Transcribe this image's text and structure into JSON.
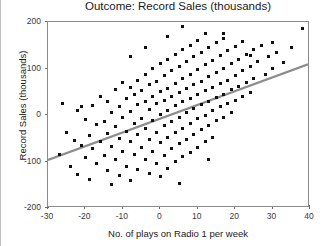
{
  "chart_data": {
    "type": "scatter",
    "title": "Outcome: Record Sales (thousands)",
    "xlabel": "No. of plays on Radio 1 per week",
    "ylabel": "Record Sales (thousands)",
    "xlim": [
      -30,
      40
    ],
    "ylim": [
      -200,
      200
    ],
    "xticks": [
      -30,
      -20,
      -10,
      0,
      10,
      20,
      30,
      40
    ],
    "yticks": [
      -200,
      -100,
      0,
      100,
      200
    ],
    "grid": false,
    "legend": null,
    "marker": "square",
    "marker_color": "#101010",
    "trendline": {
      "name": "linear fit",
      "color": "#8c8c8c",
      "x_start": -30,
      "y_start": -100,
      "x_end": 40,
      "y_end": 108,
      "slope": 2.97,
      "intercept": -10.9
    },
    "points": [
      [
        -27,
        -85
      ],
      [
        -25,
        -38
      ],
      [
        -24,
        -110
      ],
      [
        -23,
        -55
      ],
      [
        -22,
        10
      ],
      [
        -22,
        -128
      ],
      [
        -21,
        -66
      ],
      [
        -20,
        -10
      ],
      [
        -20,
        -92
      ],
      [
        -19,
        -45
      ],
      [
        -19,
        -138
      ],
      [
        -18,
        20
      ],
      [
        -18,
        -72
      ],
      [
        -17,
        -20
      ],
      [
        -17,
        -105
      ],
      [
        -16,
        40
      ],
      [
        -16,
        -58
      ],
      [
        -15,
        -15
      ],
      [
        -15,
        -88
      ],
      [
        -14,
        30
      ],
      [
        -14,
        -40
      ],
      [
        -14,
        -120
      ],
      [
        -13,
        5
      ],
      [
        -13,
        -68
      ],
      [
        -12,
        55
      ],
      [
        -12,
        -25
      ],
      [
        -12,
        -95
      ],
      [
        -11,
        18
      ],
      [
        -11,
        -50
      ],
      [
        -11,
        -130
      ],
      [
        -10,
        70
      ],
      [
        -10,
        -5
      ],
      [
        -10,
        -78
      ],
      [
        -9,
        35
      ],
      [
        -9,
        -35
      ],
      [
        -9,
        -110
      ],
      [
        -8,
        60
      ],
      [
        -8,
        8
      ],
      [
        -8,
        -58
      ],
      [
        -8,
        -140
      ],
      [
        -7,
        45
      ],
      [
        -7,
        -18
      ],
      [
        -7,
        -85
      ],
      [
        -6,
        75
      ],
      [
        -6,
        22
      ],
      [
        -6,
        -42
      ],
      [
        -6,
        -118
      ],
      [
        -5,
        52
      ],
      [
        -5,
        -8
      ],
      [
        -5,
        -70
      ],
      [
        -4,
        88
      ],
      [
        -4,
        30
      ],
      [
        -4,
        -28
      ],
      [
        -4,
        -95
      ],
      [
        -3,
        65
      ],
      [
        -3,
        12
      ],
      [
        -3,
        -52
      ],
      [
        -3,
        -125
      ],
      [
        -2,
        100
      ],
      [
        -2,
        40
      ],
      [
        -2,
        -12
      ],
      [
        -2,
        -78
      ],
      [
        -1,
        72
      ],
      [
        -1,
        25
      ],
      [
        -1,
        -38
      ],
      [
        -1,
        -105
      ],
      [
        0,
        110
      ],
      [
        0,
        50
      ],
      [
        0,
        2
      ],
      [
        0,
        -60
      ],
      [
        0,
        -132
      ],
      [
        1,
        85
      ],
      [
        1,
        32
      ],
      [
        1,
        -22
      ],
      [
        1,
        -88
      ],
      [
        2,
        120
      ],
      [
        2,
        58
      ],
      [
        2,
        10
      ],
      [
        2,
        -48
      ],
      [
        2,
        -115
      ],
      [
        3,
        95
      ],
      [
        3,
        40
      ],
      [
        3,
        -15
      ],
      [
        3,
        -72
      ],
      [
        4,
        130
      ],
      [
        4,
        68
      ],
      [
        4,
        20
      ],
      [
        4,
        -38
      ],
      [
        4,
        -100
      ],
      [
        5,
        105
      ],
      [
        5,
        48
      ],
      [
        5,
        -5
      ],
      [
        5,
        -62
      ],
      [
        6,
        140
      ],
      [
        6,
        78
      ],
      [
        6,
        28
      ],
      [
        6,
        -28
      ],
      [
        6,
        -90
      ],
      [
        7,
        115
      ],
      [
        7,
        58
      ],
      [
        7,
        5
      ],
      [
        7,
        -52
      ],
      [
        8,
        150
      ],
      [
        8,
        88
      ],
      [
        8,
        35
      ],
      [
        8,
        -18
      ],
      [
        8,
        -80
      ],
      [
        9,
        125
      ],
      [
        9,
        65
      ],
      [
        9,
        15
      ],
      [
        9,
        -42
      ],
      [
        10,
        160
      ],
      [
        10,
        98
      ],
      [
        10,
        45
      ],
      [
        10,
        -8
      ],
      [
        10,
        -70
      ],
      [
        11,
        135
      ],
      [
        11,
        72
      ],
      [
        11,
        22
      ],
      [
        11,
        -32
      ],
      [
        12,
        175
      ],
      [
        12,
        108
      ],
      [
        12,
        52
      ],
      [
        12,
        0
      ],
      [
        12,
        -58
      ],
      [
        13,
        145
      ],
      [
        13,
        82
      ],
      [
        13,
        30
      ],
      [
        13,
        -22
      ],
      [
        14,
        118
      ],
      [
        14,
        60
      ],
      [
        14,
        10
      ],
      [
        14,
        -48
      ],
      [
        15,
        155
      ],
      [
        15,
        92
      ],
      [
        15,
        38
      ],
      [
        15,
        -12
      ],
      [
        16,
        128
      ],
      [
        16,
        68
      ],
      [
        16,
        18
      ],
      [
        17,
        165
      ],
      [
        17,
        100
      ],
      [
        17,
        45
      ],
      [
        17,
        -5
      ],
      [
        18,
        138
      ],
      [
        18,
        75
      ],
      [
        18,
        25
      ],
      [
        19,
        110
      ],
      [
        19,
        55
      ],
      [
        19,
        5
      ],
      [
        20,
        148
      ],
      [
        20,
        85
      ],
      [
        20,
        32
      ],
      [
        21,
        120
      ],
      [
        21,
        62
      ],
      [
        22,
        158
      ],
      [
        22,
        95
      ],
      [
        22,
        40
      ],
      [
        23,
        130
      ],
      [
        23,
        70
      ],
      [
        24,
        105
      ],
      [
        24,
        48
      ],
      [
        25,
        140
      ],
      [
        25,
        78
      ],
      [
        26,
        115
      ],
      [
        27,
        150
      ],
      [
        28,
        88
      ],
      [
        29,
        125
      ],
      [
        30,
        100
      ],
      [
        31,
        135
      ],
      [
        33,
        112
      ],
      [
        35,
        145
      ],
      [
        38,
        185
      ],
      [
        6,
        190
      ],
      [
        -21,
        18
      ],
      [
        2,
        168
      ],
      [
        24,
        128
      ],
      [
        -13,
        -150
      ],
      [
        5,
        -148
      ],
      [
        -4,
        145
      ],
      [
        17,
        175
      ],
      [
        -26,
        25
      ],
      [
        30,
        155
      ],
      [
        -8,
        125
      ],
      [
        13,
        -95
      ]
    ]
  }
}
